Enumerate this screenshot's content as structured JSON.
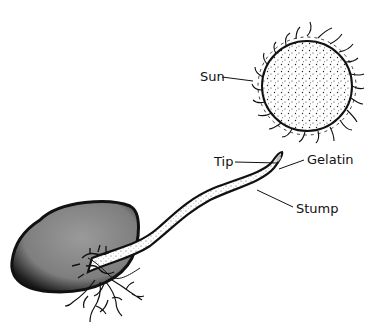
{
  "diagram": {
    "type": "labeled-illustration",
    "labels": {
      "sun": "Sun",
      "tip": "Tip",
      "gelatin": "Gelatin",
      "stump": "Stump"
    },
    "colors": {
      "ink": "#111111",
      "seed_fill": "#8a8a8a",
      "background": "#ffffff"
    }
  }
}
